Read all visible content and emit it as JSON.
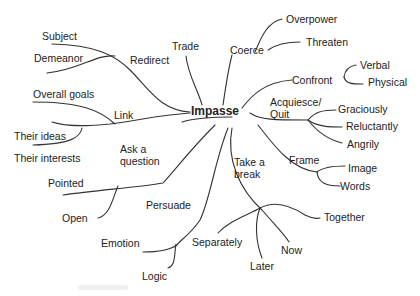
{
  "diagram": {
    "type": "mind-map",
    "center": "Impasse",
    "branches": [
      {
        "label": "Redirect",
        "children": [
          "Subject",
          "Demeanor"
        ]
      },
      {
        "label": "Trade",
        "children": []
      },
      {
        "label": "Coerce",
        "children": [
          "Overpower",
          "Threaten"
        ]
      },
      {
        "label": "Confront",
        "children": [
          "Verbal",
          "Physical"
        ]
      },
      {
        "label": "Acquiesce/\nQuit",
        "children": [
          "Graciously",
          "Reluctantly",
          "Angrily"
        ]
      },
      {
        "label": "Frame",
        "children": [
          "Image",
          "Words"
        ]
      },
      {
        "label": "Take a\nbreak",
        "children": [
          "Together",
          "Separately",
          "Now",
          "Later"
        ]
      },
      {
        "label": "Persuade",
        "children": [
          "Emotion",
          "Logic"
        ]
      },
      {
        "label": "Ask a\nquestion",
        "children": [
          "Pointed",
          "Open"
        ]
      },
      {
        "label": "Link",
        "children": [
          "Overall goals",
          "Their ideas",
          "Their interests"
        ]
      }
    ]
  },
  "labels": {
    "center": "Impasse",
    "redirect": "Redirect",
    "subject": "Subject",
    "demeanor": "Demeanor",
    "trade": "Trade",
    "coerce": "Coerce",
    "overpower": "Overpower",
    "threaten": "Threaten",
    "confront": "Confront",
    "verbal": "Verbal",
    "physical": "Physical",
    "acquiesce": "Acquiesce/\nQuit",
    "graciously": "Graciously",
    "reluctantly": "Reluctantly",
    "angrily": "Angrily",
    "frame": "Frame",
    "image": "Image",
    "words": "Words",
    "take_break": "Take a\nbreak",
    "together": "Together",
    "separately": "Separately",
    "now": "Now",
    "later": "Later",
    "persuade": "Persuade",
    "emotion": "Emotion",
    "logic": "Logic",
    "ask_question": "Ask a\nquestion",
    "pointed": "Pointed",
    "open": "Open",
    "link": "Link",
    "overall_goals": "Overall goals",
    "their_ideas": "Their ideas",
    "their_interests": "Their interests"
  },
  "colors": {
    "line": "#333333",
    "text": "#222222",
    "background": "#ffffff"
  }
}
